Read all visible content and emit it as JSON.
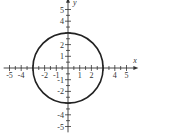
{
  "chart_data": {
    "type": "line",
    "title": "",
    "equation": "x^2 + y^2 = 9",
    "curve": "circle",
    "center": [
      0,
      0
    ],
    "radius": 3,
    "xlabel": "x",
    "ylabel": "y",
    "xlim": [
      -5.5,
      5.5
    ],
    "ylim": [
      -5.5,
      5.5
    ],
    "x_tick_labels": [
      "-5",
      "-4",
      "-2",
      "-1",
      "1",
      "2",
      "4",
      "5"
    ],
    "x_tick_values": [
      -5,
      -4,
      -2,
      -1,
      1,
      2,
      4,
      5
    ],
    "y_tick_labels": [
      "5",
      "4",
      "2",
      "1",
      "-1",
      "-2",
      "-4",
      "-5"
    ],
    "y_tick_values": [
      5,
      4,
      2,
      1,
      -1,
      -2,
      -4,
      -5
    ],
    "minor_tick_step": 0.5,
    "grid": false,
    "legend": null,
    "intercepts": {
      "x": [
        -3,
        3
      ],
      "y": [
        -3,
        3
      ]
    }
  },
  "style": {
    "axis_color": "#333333",
    "curve_color": "#222222",
    "background": "#ffffff"
  }
}
